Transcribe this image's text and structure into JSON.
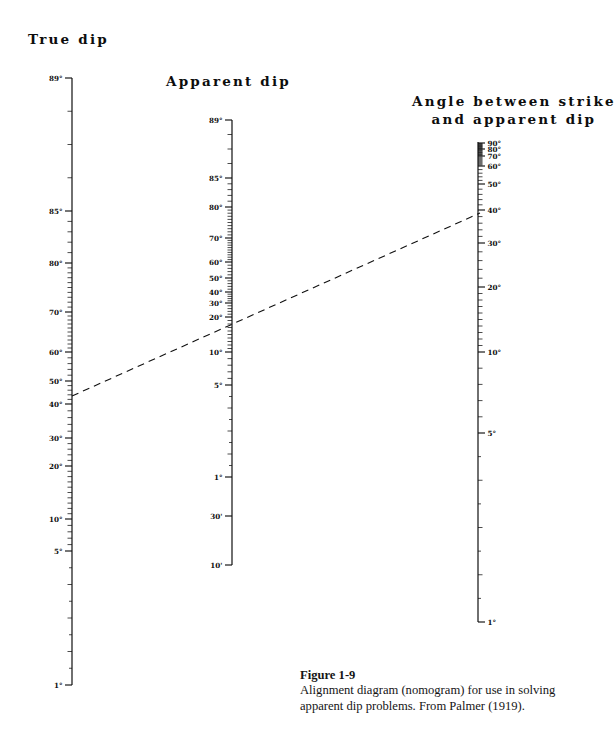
{
  "figure": {
    "caption_heading": "Figure 1-9",
    "caption_text": "Alignment diagram (nomogram) for use in solving apparent dip problems. From Palmer (1919).",
    "background": "#ffffff",
    "ink": "#101010"
  },
  "titles": {
    "true_dip": "True dip",
    "apparent_dip": "Apparent dip",
    "angle_line1": "Angle between strike",
    "angle_line2": "and apparent dip"
  },
  "chart_data": {
    "type": "nomogram",
    "axes": [
      {
        "name": "true-dip-scale",
        "label": "True dip",
        "x": 72,
        "y_top": 78,
        "y_bottom": 685,
        "top_value": "89°",
        "bottom_value": "1°",
        "units": "degrees",
        "tick_side": "left",
        "labeled_ticks": [
          {
            "value": 89,
            "text": "89°",
            "y": 78
          },
          {
            "value": 85,
            "text": "85°",
            "y": 211
          },
          {
            "value": 80,
            "text": "80°",
            "y": 263
          },
          {
            "value": 70,
            "text": "70°",
            "y": 312
          },
          {
            "value": 60,
            "text": "60°",
            "y": 352
          },
          {
            "value": 50,
            "text": "50°",
            "y": 381
          },
          {
            "value": 40,
            "text": "40°",
            "y": 404
          },
          {
            "value": 30,
            "text": "30°",
            "y": 438
          },
          {
            "value": 20,
            "text": "20°",
            "y": 466
          },
          {
            "value": 10,
            "text": "10°",
            "y": 519
          },
          {
            "value": 5,
            "text": "5°",
            "y": 551
          },
          {
            "value": 1,
            "text": "1°",
            "y": 685
          }
        ]
      },
      {
        "name": "apparent-dip-scale",
        "label": "Apparent dip",
        "x": 232,
        "y_top": 120,
        "y_bottom": 565,
        "top_value": "89°",
        "bottom_value": "10'",
        "units": "degrees and minutes",
        "tick_side": "left",
        "labeled_ticks": [
          {
            "value": 89,
            "text": "89°",
            "y": 120
          },
          {
            "value": 85,
            "text": "85°",
            "y": 178
          },
          {
            "value": 80,
            "text": "80°",
            "y": 207
          },
          {
            "value": 70,
            "text": "70°",
            "y": 238
          },
          {
            "value": 60,
            "text": "60°",
            "y": 262
          },
          {
            "value": 50,
            "text": "50°",
            "y": 278
          },
          {
            "value": 40,
            "text": "40°",
            "y": 292
          },
          {
            "value": 30,
            "text": "30°",
            "y": 303
          },
          {
            "value": 20,
            "text": "20°",
            "y": 317
          },
          {
            "value": 10,
            "text": "10°",
            "y": 352
          },
          {
            "value": 5,
            "text": "5°",
            "y": 385
          },
          {
            "value": 1,
            "text": "1°",
            "y": 477
          },
          {
            "value": 0.5,
            "text": "30'",
            "y": 516
          },
          {
            "value": 0.1667,
            "text": "10'",
            "y": 565
          }
        ]
      },
      {
        "name": "strike-angle-scale",
        "label": "Angle between strike and apparent dip",
        "x": 478,
        "y_top": 142,
        "y_bottom": 622,
        "top_value": "90°",
        "bottom_value": "1°",
        "units": "degrees",
        "tick_side": "right",
        "labeled_ticks": [
          {
            "value": 90,
            "text": "90°",
            "y": 143
          },
          {
            "value": 80,
            "text": "80°",
            "y": 149
          },
          {
            "value": 70,
            "text": "70°",
            "y": 156
          },
          {
            "value": 60,
            "text": "60°",
            "y": 166
          },
          {
            "value": 50,
            "text": "50°",
            "y": 184
          },
          {
            "value": 40,
            "text": "40°",
            "y": 210
          },
          {
            "value": 30,
            "text": "30°",
            "y": 243
          },
          {
            "value": 20,
            "text": "20°",
            "y": 287
          },
          {
            "value": 10,
            "text": "10°",
            "y": 352
          },
          {
            "value": 5,
            "text": "5°",
            "y": 433
          },
          {
            "value": 1,
            "text": "1°",
            "y": 622
          }
        ]
      }
    ],
    "construction_line": {
      "name": "alignment-dashed-line",
      "style": "dashed",
      "from": {
        "axis": "true-dip-scale",
        "x": 72,
        "y": 396,
        "approx_value": "41°"
      },
      "through": {
        "axis": "apparent-dip-scale",
        "x": 232,
        "y": 300,
        "approx_value": "27°"
      },
      "to": {
        "axis": "strike-angle-scale",
        "x": 480,
        "y": 213,
        "approx_value": "35°"
      }
    }
  }
}
